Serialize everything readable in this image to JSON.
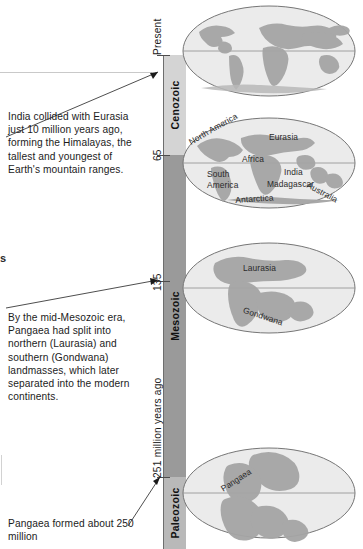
{
  "figure": {
    "axis_label_unit": "million years ago"
  },
  "captions": [
    {
      "id": "india",
      "text": "India collided with Eurasia just 10 million years ago, forming the Himalayas, the tallest and youngest of Earth's mountain ranges."
    },
    {
      "id": "mesozoic",
      "text": "By the mid-Mesozoic era, Pangaea had split into northern (Laurasia) and southern (Gondwana) landmasses, which later separated into the modern continents."
    },
    {
      "id": "pangaea",
      "text": "Pangaea formed about 250 million"
    }
  ],
  "axis": {
    "ticks": [
      {
        "label": "Present",
        "value": 0
      },
      {
        "label": "65",
        "value": 65
      },
      {
        "label": "135",
        "value": 135
      },
      {
        "label": "251 million years ago",
        "value": 251
      }
    ]
  },
  "eras": [
    {
      "name": "Cenozoic",
      "color": "#d4d4d4",
      "start": 0,
      "end": 65
    },
    {
      "name": "Mesozoic",
      "color": "#9a9a9a",
      "start": 65,
      "end": 251
    },
    {
      "name": "Paleozoic",
      "color": "#b9b9b9",
      "start": 251,
      "end": 300
    }
  ],
  "globes": [
    {
      "id": "present",
      "era": "Cenozoic",
      "time_label": "Present",
      "landmasses": []
    },
    {
      "id": "cenozoic",
      "era": "Cenozoic",
      "time_label": "65",
      "landmasses": [
        "North America",
        "Eurasia",
        "Africa",
        "South America",
        "India",
        "Madagascar",
        "Australia",
        "Antarctica"
      ]
    },
    {
      "id": "mesozoic",
      "era": "Mesozoic",
      "time_label": "135",
      "landmasses": [
        "Laurasia",
        "Gondwana"
      ]
    },
    {
      "id": "paleozoic",
      "era": "Paleozoic",
      "time_label": "251",
      "landmasses": [
        "Pangaea"
      ]
    }
  ],
  "fragments": {
    "left_edge_letter": "s"
  },
  "colors": {
    "cenozoic_band": "#d4d4d4",
    "mesozoic_band": "#9a9a9a",
    "paleozoic_band": "#b9b9b9",
    "ocean": "#e9e9e9",
    "land": "#a8a8a8",
    "axis": "#6e6e6e",
    "text": "#1c1c1c"
  }
}
